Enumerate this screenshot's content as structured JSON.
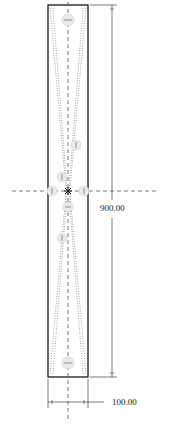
{
  "drawing": {
    "type": "technical-drawing",
    "shape": "rectangular-plate",
    "colors": {
      "outline": "#1a1a1a",
      "centerline": "#555555",
      "taper_lines": "#888888",
      "markers_fill": "#e6e6e6",
      "dimension": "#444444"
    }
  },
  "dimensions": {
    "height_label": "900.00",
    "width_label": "100.00"
  }
}
